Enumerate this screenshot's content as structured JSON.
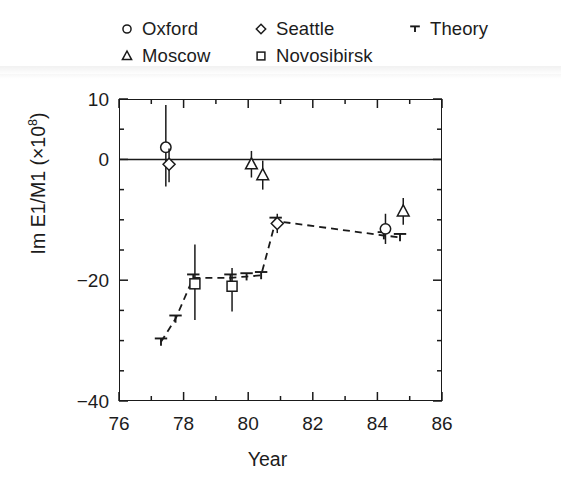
{
  "figure": {
    "background_color": "#ffffff",
    "ink_color": "#1a1a1a"
  },
  "legend": {
    "position": "above-plot",
    "rows": [
      [
        {
          "marker": "circle-open-marker",
          "label": "Oxford",
          "x": 0
        },
        {
          "marker": "diamond-open-marker",
          "label": "Seattle",
          "x": 134
        },
        {
          "marker": "theory-tee-marker",
          "label": "Theory",
          "x": 288
        }
      ],
      [
        {
          "marker": "triangle-open-marker",
          "label": "Moscow",
          "x": 0
        },
        {
          "marker": "square-open-marker",
          "label": "Novosibirsk",
          "x": 134
        }
      ]
    ]
  },
  "axes": {
    "x": {
      "title": "Year",
      "min": 76,
      "max": 86,
      "major_ticks": [
        76,
        78,
        80,
        82,
        84,
        86
      ],
      "tick_labels": [
        "76",
        "78",
        "80",
        "82",
        "84",
        "86"
      ],
      "minor_ticks": [
        77,
        79,
        81,
        83,
        85
      ]
    },
    "y": {
      "title": "Im E1/M1 (×10",
      "title_exponent": "8",
      "title_suffix": ")",
      "min": -40,
      "max": 10,
      "major_ticks": [
        10,
        0,
        -20,
        -40
      ],
      "tick_labels": [
        "10",
        "0",
        "−20",
        "−40"
      ],
      "minor_ticks": [
        5,
        -5,
        -10,
        -15,
        -25,
        -30,
        -35
      ]
    },
    "zero_line": 0
  },
  "chart_data": {
    "type": "scatter",
    "title": "",
    "xlabel": "Year",
    "ylabel": "Im E1/M1 (×10^8)",
    "xlim": [
      76,
      86
    ],
    "ylim": [
      -40,
      10
    ],
    "grid": false,
    "legend_position": "above",
    "zero_reference_line": 0,
    "series": [
      {
        "name": "Oxford",
        "marker": "circle-open-marker",
        "points": [
          {
            "x": 77.45,
            "y": 2.0,
            "yerr_low": 6.5,
            "yerr_high": 7.0
          },
          {
            "x": 84.25,
            "y": -11.5,
            "yerr_low": 2.5,
            "yerr_high": 2.5
          }
        ]
      },
      {
        "name": "Seattle",
        "marker": "diamond-open-marker",
        "points": [
          {
            "x": 77.55,
            "y": -0.8,
            "yerr_low": 3.0,
            "yerr_high": 2.6
          },
          {
            "x": 80.9,
            "y": -10.6,
            "yerr_low": 1.6,
            "yerr_high": 1.6
          }
        ]
      },
      {
        "name": "Moscow",
        "marker": "triangle-open-marker",
        "points": [
          {
            "x": 80.1,
            "y": -0.8,
            "yerr_low": 2.2,
            "yerr_high": 2.2
          },
          {
            "x": 80.45,
            "y": -2.6,
            "yerr_low": 2.4,
            "yerr_high": 2.4
          },
          {
            "x": 84.8,
            "y": -8.6,
            "yerr_low": 2.2,
            "yerr_high": 2.2
          }
        ]
      },
      {
        "name": "Novosibirsk",
        "marker": "square-open-marker",
        "points": [
          {
            "x": 78.35,
            "y": -20.6,
            "yerr_low": 6.0,
            "yerr_high": 6.5
          },
          {
            "x": 79.5,
            "y": -21.0,
            "yerr_low": 4.2,
            "yerr_high": 3.0
          }
        ]
      },
      {
        "name": "Theory",
        "marker": "theory-tee-marker",
        "linestyle": "dashed",
        "points": [
          {
            "x": 77.3,
            "y": -30.2
          },
          {
            "x": 77.75,
            "y": -26.4
          },
          {
            "x": 78.3,
            "y": -19.6
          },
          {
            "x": 79.45,
            "y": -19.6
          },
          {
            "x": 79.95,
            "y": -19.4
          },
          {
            "x": 80.4,
            "y": -19.2
          },
          {
            "x": 80.85,
            "y": -10.2
          },
          {
            "x": 84.2,
            "y": -12.6
          },
          {
            "x": 84.7,
            "y": -12.9
          }
        ]
      }
    ]
  }
}
